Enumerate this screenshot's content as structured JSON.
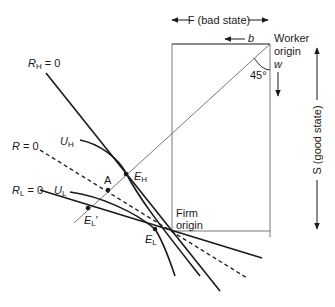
{
  "diagram": {
    "type": "edgeworth-box-insurance",
    "axes": {
      "horizontal_label": "F (bad state)",
      "vertical_label": "S (good state)",
      "b_label": "b",
      "w_label": "w",
      "angle_label": "45°"
    },
    "origins": {
      "worker": [
        "Worker",
        "origin"
      ],
      "firm": [
        "Firm",
        "origin"
      ]
    },
    "lines": {
      "rh": {
        "name": "R",
        "sub": "H",
        "suffix": " = 0"
      },
      "r": {
        "name": "R",
        "suffix": " = 0"
      },
      "rl": {
        "name": "R",
        "sub": "L",
        "suffix": " = 0"
      }
    },
    "curves": {
      "uh": {
        "name": "U",
        "sub": "H"
      },
      "ul": {
        "name": "U",
        "sub": "L"
      }
    },
    "points": {
      "eh": {
        "name": "E",
        "sub": "H"
      },
      "a": {
        "name": "A"
      },
      "el_prime": {
        "name": "E",
        "sub": "L",
        "suffix": "′"
      },
      "el": {
        "name": "E",
        "sub": "L"
      }
    },
    "colors": {
      "ink": "#1a1a1a",
      "thin": "#555555"
    }
  }
}
